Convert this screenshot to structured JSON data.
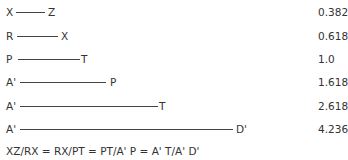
{
  "rows": [
    {
      "start": "X",
      "end": "Z",
      "value": "0.382"
    },
    {
      "start": "R",
      "end": "X",
      "value": "0.618"
    },
    {
      "start": "P",
      "end": "T",
      "value": "1.0"
    },
    {
      "start": "A'",
      "end": "P",
      "value": "1.618"
    },
    {
      "start": "A'",
      "end": "T",
      "value": "2.618"
    },
    {
      "start": "A'",
      "end": "D'",
      "value": "4.236"
    }
  ],
  "formula": "XZ/RX = RX/PT = PT/A' P = A' T/A' D'"
}
